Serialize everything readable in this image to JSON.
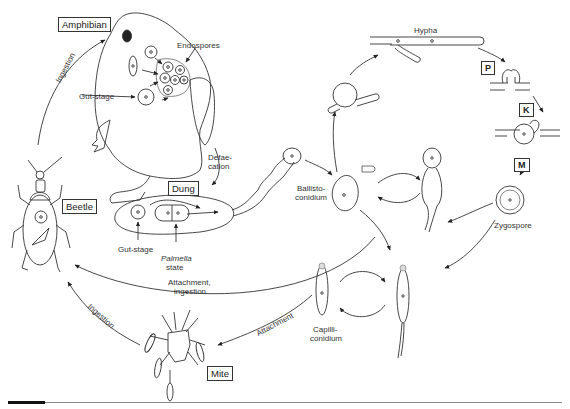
{
  "figure": {
    "hosts": {
      "amphibian": "Amphibian",
      "beetle": "Beetle",
      "mite": "Mite",
      "dung": "Dung"
    },
    "labels": {
      "endospores": "Endospores",
      "gut_stage_frog": "Gut-stage",
      "gut_stage_dung": "Gut-stage",
      "palmella_1": "Palmella",
      "palmella_2": "state",
      "defaecation_1": "Defae-",
      "defaecation_2": "cation",
      "ballisto_1": "Ballisto-",
      "ballisto_2": "conidium",
      "hypha": "Hypha",
      "zygospore": "Zygospore",
      "capilli_1": "Capilli-",
      "capilli_2": "conidium",
      "attach_ingest_1": "Attachment,",
      "attach_ingest_2": "ingestion",
      "attachment": "Attachment",
      "ingestion_left": "Ingestion",
      "ingestion_lower": "Ingestion"
    },
    "stages": {
      "p": "P",
      "k": "K",
      "m": "M"
    }
  }
}
